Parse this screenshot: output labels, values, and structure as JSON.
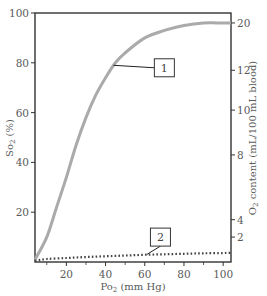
{
  "chart_data": {
    "type": "line",
    "title": "",
    "xlabel": "Po₂ (mm Hg)",
    "ylabel": "So₂ (%)",
    "y2label": "O₂ content (mL/100 mL blood)",
    "xlim": [
      4,
      104
    ],
    "ylim": [
      0,
      100
    ],
    "x_ticks": [
      20,
      40,
      60,
      80,
      100
    ],
    "x_minor_ticks": [
      10,
      30,
      50,
      70,
      90
    ],
    "y_ticks": [
      20,
      40,
      60,
      80,
      100
    ],
    "y2_ticks": [
      {
        "label": "20",
        "y_pos": 96
      },
      {
        "label": "12",
        "y_pos": 77
      },
      {
        "label": "10",
        "y_pos": 61
      },
      {
        "label": "8",
        "y_pos": 43
      },
      {
        "label": "4",
        "y_pos": 17
      },
      {
        "label": "2",
        "y_pos": 10
      }
    ],
    "grid": false,
    "series": [
      {
        "name": "1",
        "style": "solid",
        "color": "#aaaaaa",
        "x": [
          4,
          10,
          15,
          20,
          25,
          30,
          35,
          40,
          45,
          50,
          60,
          70,
          80,
          90,
          100,
          104
        ],
        "y": [
          1,
          10,
          22,
          34,
          47,
          58,
          67,
          74,
          80,
          84,
          90,
          93,
          95,
          96,
          96,
          96
        ]
      },
      {
        "name": "2",
        "style": "dotted",
        "color": "#444444",
        "x": [
          4,
          10,
          20,
          30,
          40,
          50,
          60,
          70,
          80,
          90,
          100,
          104
        ],
        "y": [
          0.5,
          1.2,
          1.6,
          2.0,
          2.3,
          2.6,
          2.9,
          3.1,
          3.3,
          3.5,
          3.6,
          3.7
        ]
      }
    ],
    "annotations": [
      {
        "label": "1",
        "box_x": 70,
        "box_y": 78,
        "points_to_x": 44,
        "points_to_y": 79
      },
      {
        "label": "2",
        "box_x": 68,
        "box_y": 10,
        "points_to_x": 61,
        "points_to_y": 3
      }
    ]
  },
  "labels": {
    "x_axis": "Po",
    "x_axis_sub": "2",
    "x_axis_unit": " (mm Hg)",
    "y_axis": "So",
    "y_axis_sub": "2",
    "y_axis_unit": " (%)",
    "y2_axis": "O",
    "y2_axis_sub": "2",
    "y2_axis_unit": " content (mL/100 mL blood)",
    "callout_1": "1",
    "callout_2": "2"
  }
}
